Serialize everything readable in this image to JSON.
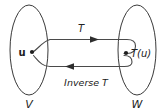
{
  "diagram": {
    "type": "function-mapping-diagram",
    "background_color": "#ffffff",
    "stroke_color": "#3a3a3a",
    "text_color": "#222222",
    "sets": {
      "domain": {
        "label": "V",
        "shape": "ellipse",
        "cx": 29,
        "cy": 50,
        "rx": 19,
        "ry": 45
      },
      "codomain": {
        "label": "W",
        "shape": "ellipse",
        "cx": 137,
        "cy": 50,
        "rx": 19,
        "ry": 45
      }
    },
    "points": {
      "source": {
        "label": "u",
        "dot_x": 32,
        "dot_y": 52
      },
      "target": {
        "label": "T(u)",
        "dot_x": 126,
        "dot_y": 53
      }
    },
    "arrows": {
      "forward": {
        "label": "T",
        "direction": "right",
        "label_x": 81,
        "label_y": 32
      },
      "backward": {
        "label": "Inverse T",
        "direction": "left",
        "label_x": 86,
        "label_y": 85
      }
    }
  }
}
